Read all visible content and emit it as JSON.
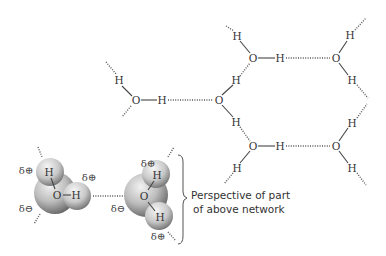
{
  "diagram": {
    "atom_labels": {
      "oxygen": "O",
      "hydrogen": "H"
    },
    "charges": {
      "delta_plus": "δ⊕",
      "delta_minus": "δ⊖"
    },
    "caption": {
      "line1": "Perspective of part",
      "line2": "of above network"
    },
    "colors": {
      "ink": "#333333",
      "sphere_light": "#e6e6e6",
      "sphere_dark": "#6e6e6e",
      "background": "#ffffff"
    }
  }
}
